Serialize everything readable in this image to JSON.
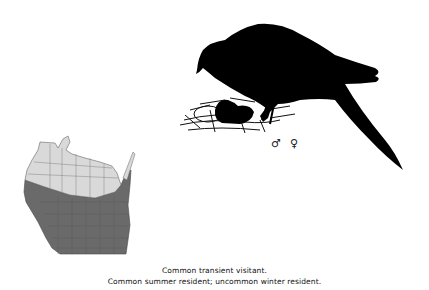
{
  "illustration": {
    "subject": "bird silhouette perched on nest",
    "sex_symbols": {
      "male": "♂",
      "female": "♀"
    }
  },
  "range_map": {
    "region": "Wisconsin",
    "colors": {
      "north": "#d9d9d9",
      "south": "#6a6a6a",
      "border": "#555555"
    }
  },
  "caption": {
    "line1": "Common transient visitant.",
    "line2": "Common summer resident; uncommon winter resident."
  }
}
